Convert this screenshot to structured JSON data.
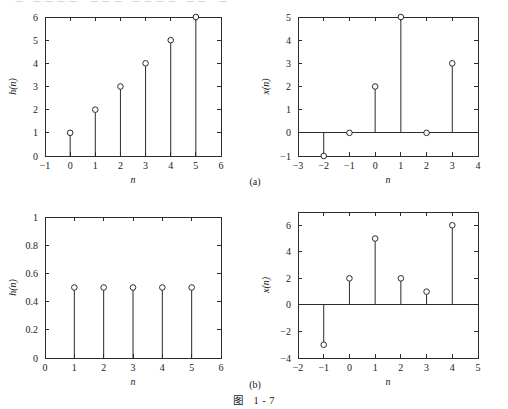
{
  "figure": {
    "caption_label": "图",
    "caption_number": "1 - 7",
    "top_artifact_text": "、一、一 一 一 一、 一 一 一、一 一 一 一、一 一、 一",
    "group_labels": [
      {
        "name": "group-a",
        "text": "(a)"
      },
      {
        "name": "group-b",
        "text": "(b)"
      }
    ]
  },
  "chart_data": [
    {
      "id": "plot-top-left",
      "type": "stem",
      "title": "",
      "xlabel": "n",
      "ylabel": "h(n)",
      "xlim": [
        -1,
        6
      ],
      "ylim": [
        0,
        6
      ],
      "xticks": [
        -1,
        0,
        1,
        2,
        3,
        4,
        5,
        6
      ],
      "xticklabels": [
        "−1",
        "0",
        "1",
        "2",
        "3",
        "4",
        "5",
        "6"
      ],
      "yticks": [
        0,
        1,
        2,
        3,
        4,
        5,
        6
      ],
      "yticklabels": [
        "0",
        "1",
        "2",
        "3",
        "4",
        "5",
        "6"
      ],
      "grid": false,
      "baseline": 0,
      "x": [
        0,
        1,
        2,
        3,
        4,
        5
      ],
      "values": [
        1,
        2,
        3,
        4,
        5,
        6
      ]
    },
    {
      "id": "plot-top-right",
      "type": "stem",
      "title": "",
      "xlabel": "n",
      "ylabel": "x(n)",
      "xlim": [
        -3,
        4
      ],
      "ylim": [
        -1,
        5
      ],
      "xticks": [
        -3,
        -2,
        -1,
        0,
        1,
        2,
        3,
        4
      ],
      "xticklabels": [
        "−3",
        "−2",
        "−1",
        "0",
        "1",
        "2",
        "3",
        "4"
      ],
      "yticks": [
        -1,
        0,
        1,
        2,
        3,
        4,
        5
      ],
      "yticklabels": [
        "−1",
        "0",
        "1",
        "2",
        "3",
        "4",
        "5"
      ],
      "grid": false,
      "baseline": 0,
      "x": [
        -2,
        -1,
        0,
        1,
        2,
        3
      ],
      "values": [
        -1,
        0,
        2,
        5,
        0,
        3
      ]
    },
    {
      "id": "plot-bottom-left",
      "type": "stem",
      "title": "",
      "xlabel": "n",
      "ylabel": "h(n)",
      "xlim": [
        0,
        6
      ],
      "ylim": [
        0,
        1
      ],
      "xticks": [
        0,
        1,
        2,
        3,
        4,
        5,
        6
      ],
      "xticklabels": [
        "0",
        "1",
        "2",
        "3",
        "4",
        "5",
        "6"
      ],
      "yticks": [
        0,
        0.2,
        0.4,
        0.6,
        0.8,
        1
      ],
      "yticklabels": [
        "0",
        "0.2",
        "0.4",
        "0.6",
        "0.8",
        "1"
      ],
      "grid": false,
      "baseline": 0,
      "x": [
        1,
        2,
        3,
        4,
        5
      ],
      "values": [
        0.5,
        0.5,
        0.5,
        0.5,
        0.5
      ]
    },
    {
      "id": "plot-bottom-right",
      "type": "stem",
      "title": "",
      "xlabel": "n",
      "ylabel": "x(n)",
      "xlim": [
        -2,
        5
      ],
      "ylim": [
        -4,
        7
      ],
      "xticks": [
        -2,
        -1,
        0,
        1,
        2,
        3,
        4,
        5
      ],
      "xticklabels": [
        "−2",
        "−1",
        "0",
        "1",
        "2",
        "3",
        "4",
        "5"
      ],
      "yticks": [
        -4,
        -2,
        0,
        2,
        4,
        6
      ],
      "yticklabels": [
        "−4",
        "−2",
        "0",
        "2",
        "4",
        "6"
      ],
      "grid": false,
      "baseline": 0,
      "x": [
        -1,
        0,
        1,
        2,
        3,
        4
      ],
      "values": [
        -3,
        2,
        5,
        2,
        1,
        6
      ]
    }
  ]
}
